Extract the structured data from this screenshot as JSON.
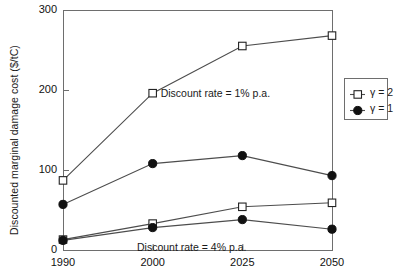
{
  "chart_data": {
    "type": "line",
    "title": "",
    "xlabel": "",
    "ylabel": "Discounted marginal damage cost ($/tC)",
    "categories": [
      "1990",
      "2000",
      "2025",
      "2050"
    ],
    "xlim": [
      0,
      3
    ],
    "ylim": [
      0,
      300
    ],
    "yticks": [
      0,
      100,
      200,
      300
    ],
    "ytick_labels": [
      "0",
      "100",
      "200",
      "300"
    ],
    "xtick_labels": [
      "1990",
      "2000",
      "2025",
      "2050"
    ],
    "grid": false,
    "legend_position": "right-outside",
    "series": [
      {
        "name": "gamma = 2 (1% p.a.)",
        "legend_key": "γ = 2",
        "group": "Discount rate  =  1% p.a.",
        "marker": "open-square",
        "values": [
          87,
          196,
          255,
          268
        ]
      },
      {
        "name": "gamma = 1 (1% p.a.)",
        "legend_key": "γ = 1",
        "group": "Discount rate  =  1% p.a.",
        "marker": "filled-circle",
        "values": [
          57,
          108,
          118,
          93
        ]
      },
      {
        "name": "gamma = 2 (4% p.a.)",
        "legend_key": "γ = 2",
        "group": "Discount rate  =  4% p.a.",
        "marker": "open-square",
        "values": [
          13,
          33,
          54,
          59
        ]
      },
      {
        "name": "gamma = 1 (4% p.a.)",
        "legend_key": "γ = 1",
        "group": "Discount rate  =  4% p.a.",
        "marker": "filled-circle",
        "values": [
          12,
          28,
          38,
          26
        ]
      }
    ],
    "annotations": [
      {
        "text": "Discount rate  =  1% p.a.",
        "x": 1.0,
        "y": 196
      },
      {
        "text": "Discount rate  =  4% p.a.",
        "x": 1.45,
        "y": 14
      }
    ],
    "legend": [
      {
        "label": "γ = 2",
        "marker": "open-square"
      },
      {
        "label": "γ = 1",
        "marker": "filled-circle"
      }
    ],
    "colors": {
      "line": "#4d4d4d",
      "marker_fill_open": "#ffffff",
      "marker_fill_solid": "#111111",
      "axis": "#6e6e6e",
      "text": "#1a1a1a",
      "background": "#ffffff"
    }
  }
}
